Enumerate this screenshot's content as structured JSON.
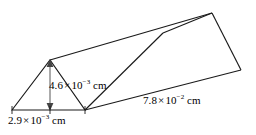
{
  "figure": {
    "background_color": "#ffffff",
    "stroke_color": "#1a1a1a",
    "shape": "triangular prism",
    "labels": {
      "height": {
        "mantissa": "4.6",
        "multiplication_sign": "×",
        "base": "10",
        "exponent": "−3",
        "unit": "cm",
        "full_text": "4.6 × 10⁻³ cm",
        "measures": "triangle height"
      },
      "base": {
        "mantissa": "2.9",
        "multiplication_sign": "×",
        "base": "10",
        "exponent": "−3",
        "unit": "cm",
        "full_text": "2.9 × 10⁻³ cm",
        "measures": "triangle base"
      },
      "length": {
        "mantissa": "7.8",
        "multiplication_sign": "×",
        "base": "10",
        "exponent": "−2",
        "unit": "cm",
        "full_text": "7.8 × 10⁻² cm",
        "measures": "prism length"
      }
    }
  }
}
